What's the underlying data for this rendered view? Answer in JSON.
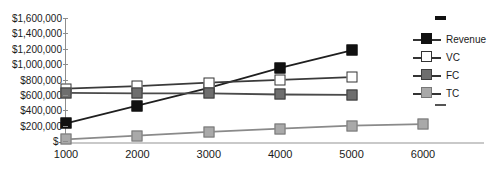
{
  "chart_data": {
    "type": "line",
    "title": "",
    "xlabel": "",
    "ylabel": "",
    "x": [
      1000,
      2000,
      3000,
      4000,
      5000,
      6000
    ],
    "xtick_labels": [
      "1000",
      "2000",
      "3000",
      "4000",
      "5000",
      "6000"
    ],
    "ytick_labels": [
      "$1,600,000",
      "$1,400,000",
      "$1,200,000",
      "$1,000,000",
      "$800,000",
      "$600,000",
      "$400,000",
      "$200,000",
      "$-"
    ],
    "ytick_values": [
      1600000,
      1400000,
      1200000,
      1000000,
      800000,
      600000,
      400000,
      200000,
      0
    ],
    "ylim": [
      0,
      1600000
    ],
    "xlim": [
      1000,
      6000
    ],
    "grid": false,
    "legend_position": "right",
    "series": [
      {
        "name": "Revenue",
        "marker": "filled-square",
        "color": "#111111",
        "values": [
          230000,
          460000,
          690000,
          950000,
          1180000,
          null
        ]
      },
      {
        "name": "VC",
        "marker": "open-square",
        "color": "#ffffff",
        "values": [
          680000,
          715000,
          760000,
          795000,
          830000,
          null
        ]
      },
      {
        "name": "FC",
        "marker": "dark-gray-square",
        "color": "#6e6e6e",
        "values": [
          625000,
          620000,
          620000,
          605000,
          600000,
          null
        ]
      },
      {
        "name": "TC",
        "marker": "light-gray-square",
        "color": "#a9a9a9",
        "values": [
          20000,
          70000,
          120000,
          160000,
          200000,
          220000
        ]
      }
    ]
  },
  "legend": {
    "items": [
      {
        "label": "Revenue"
      },
      {
        "label": "VC"
      },
      {
        "label": "FC"
      },
      {
        "label": "TC"
      }
    ]
  }
}
